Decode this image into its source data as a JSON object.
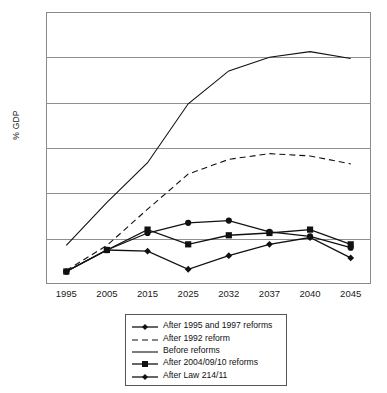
{
  "chart_data": {
    "type": "line",
    "title": "",
    "xlabel": "",
    "ylabel": "% GDP",
    "categories": [
      "1995",
      "2005",
      "2015",
      "2025",
      "2032",
      "2037",
      "2040",
      "2045"
    ],
    "ylim": [
      13,
      25
    ],
    "yticks": [
      13,
      15,
      17,
      19,
      21,
      23,
      25
    ],
    "grid": true,
    "legend_position": "below-center",
    "series": [
      {
        "name": "After 1995 and 1997 reforms",
        "marker": "circle",
        "style": "solid",
        "values": [
          13.55,
          14.5,
          15.25,
          15.7,
          15.8,
          15.3,
          15.1,
          14.6
        ]
      },
      {
        "name": "After 1992 reform",
        "marker": "none",
        "style": "dashed",
        "values": [
          13.6,
          14.7,
          16.3,
          17.85,
          18.5,
          18.75,
          18.65,
          18.3
        ]
      },
      {
        "name": "Before reforms",
        "marker": "none",
        "style": "solid",
        "values": [
          14.7,
          16.6,
          18.35,
          20.95,
          22.4,
          23.0,
          23.25,
          22.95
        ]
      },
      {
        "name": "After 2004/09/10 reforms",
        "marker": "square",
        "style": "solid",
        "values": [
          13.55,
          14.5,
          15.4,
          14.75,
          15.15,
          15.25,
          15.4,
          14.75
        ]
      },
      {
        "name": "After Law 214/11",
        "marker": "diamond",
        "style": "solid",
        "values": [
          13.55,
          14.5,
          14.45,
          13.65,
          14.25,
          14.75,
          15.05,
          14.15
        ]
      }
    ]
  },
  "legend": {
    "items": [
      {
        "label": "After 1995 and 1997 reforms",
        "swatch": "line-circle-marker"
      },
      {
        "label": "After 1992 reform",
        "swatch": "dashed-line"
      },
      {
        "label": "Before reforms",
        "swatch": "solid-line"
      },
      {
        "label": "After 2004/09/10 reforms",
        "swatch": "line-square-marker"
      },
      {
        "label": "After Law 214/11",
        "swatch": "line-diamond-marker"
      }
    ]
  }
}
